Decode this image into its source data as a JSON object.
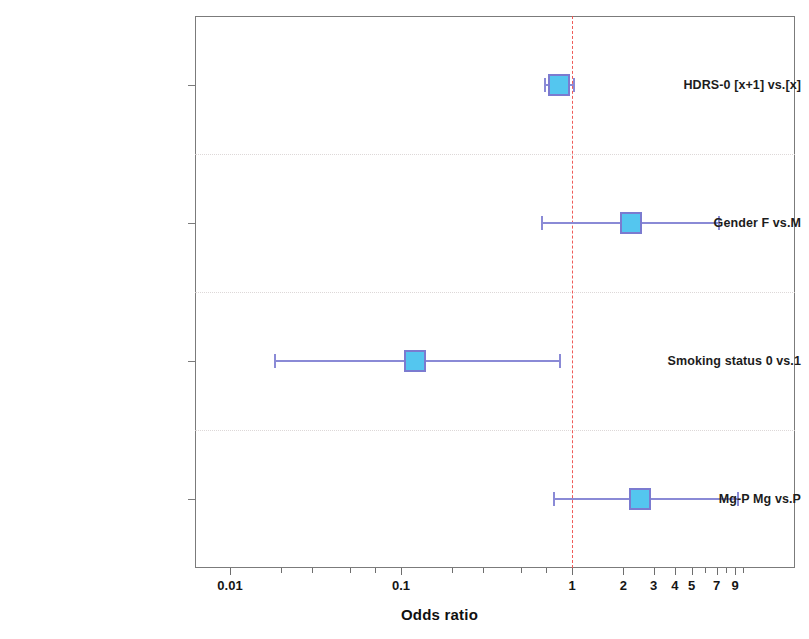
{
  "chart_data": {
    "type": "scatter",
    "subtype": "forest-plot",
    "title": "",
    "xlabel": "Odds ratio",
    "ylabel": "",
    "xscale": "log",
    "xlim": [
      0.004,
      12
    ],
    "grid": true,
    "legend": null,
    "reference_line": {
      "value": 1,
      "style": "dashed",
      "color": "#ef5350"
    },
    "xticks": [
      {
        "value": 0.01,
        "label": "0.01",
        "type": "major"
      },
      {
        "value": 0.1,
        "label": "0.1",
        "type": "major"
      },
      {
        "value": 1,
        "label": "1",
        "type": "major"
      },
      {
        "value": 2,
        "label": "2",
        "type": "major"
      },
      {
        "value": 3,
        "label": "3",
        "type": "major"
      },
      {
        "value": 4,
        "label": "4",
        "type": "major"
      },
      {
        "value": 5,
        "label": "5",
        "type": "major"
      },
      {
        "value": 7,
        "label": "7",
        "type": "major"
      },
      {
        "value": 9,
        "label": "9",
        "type": "major"
      },
      {
        "value": 0.02,
        "label": "",
        "type": "minor"
      },
      {
        "value": 0.03,
        "label": "",
        "type": "minor"
      },
      {
        "value": 0.05,
        "label": "",
        "type": "minor"
      },
      {
        "value": 0.07,
        "label": "",
        "type": "minor"
      },
      {
        "value": 0.2,
        "label": "",
        "type": "minor"
      },
      {
        "value": 0.3,
        "label": "",
        "type": "minor"
      },
      {
        "value": 0.5,
        "label": "",
        "type": "minor"
      },
      {
        "value": 0.7,
        "label": "",
        "type": "minor"
      },
      {
        "value": 6,
        "label": "",
        "type": "minor"
      },
      {
        "value": 8,
        "label": "",
        "type": "minor"
      },
      {
        "value": 10,
        "label": "",
        "type": "minor"
      }
    ],
    "categories": [
      "HDRS-0 [x+1] vs.[x]",
      "Gender F vs.M",
      "Smoking status  0 vs.1",
      "Mg-P  Mg vs.P"
    ],
    "rows": [
      {
        "label": "HDRS-0 [x+1] vs.[x]",
        "estimate": 0.84,
        "ci_low": 0.69,
        "ci_high": 1.02,
        "marker_color": "#54c6ef",
        "line_color": "#8a8ad6"
      },
      {
        "label": "Gender F vs.M",
        "estimate": 2.2,
        "ci_low": 0.66,
        "ci_high": 7.1,
        "marker_color": "#54c6ef",
        "line_color": "#8a8ad6"
      },
      {
        "label": "Smoking status  0 vs.1",
        "estimate": 0.12,
        "ci_low": 0.018,
        "ci_high": 0.84,
        "marker_color": "#54c6ef",
        "line_color": "#8a8ad6"
      },
      {
        "label": "Mg-P  Mg vs.P",
        "estimate": 2.5,
        "ci_low": 0.77,
        "ci_high": 9.2,
        "marker_color": "#54c6ef",
        "line_color": "#8a8ad6"
      }
    ]
  }
}
